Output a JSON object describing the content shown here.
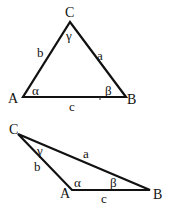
{
  "diagram": {
    "stroke_color": "#111111",
    "triangles": [
      {
        "name": "acute-triangle",
        "vertices": {
          "A": {
            "label": "A",
            "x": 23,
            "y": 97
          },
          "B": {
            "label": "B",
            "x": 126,
            "y": 97
          },
          "C": {
            "label": "C",
            "x": 70,
            "y": 22
          }
        },
        "sides": {
          "a": "a",
          "b": "b",
          "c": "c"
        },
        "angles": {
          "alpha": "α",
          "beta": "β",
          "gamma": "γ"
        },
        "tick_mark": "s"
      },
      {
        "name": "obtuse-triangle",
        "vertices": {
          "A": {
            "label": "A",
            "x": 72,
            "y": 190
          },
          "B": {
            "label": "B",
            "x": 150,
            "y": 190
          },
          "C": {
            "label": "C",
            "x": 18,
            "y": 134
          }
        },
        "sides": {
          "a": "a",
          "b": "b",
          "c": "c"
        },
        "angles": {
          "alpha": "α",
          "beta": "β",
          "gamma": "γ"
        }
      }
    ]
  }
}
